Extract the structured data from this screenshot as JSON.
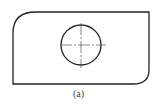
{
  "figure": {
    "caption": "(a)",
    "shape": "plate-with-rounded-corners",
    "features": [
      "outline",
      "circle-hole",
      "center-lines"
    ],
    "stroke_color": "#222222"
  }
}
